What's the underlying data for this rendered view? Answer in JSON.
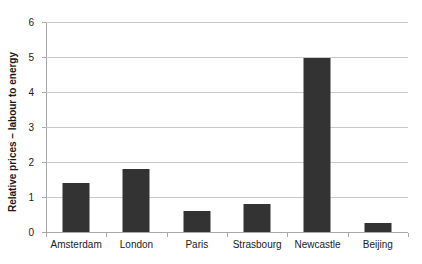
{
  "chart_data": {
    "type": "bar",
    "title": "",
    "xlabel": "",
    "ylabel": "Relative prices – labour to energy",
    "categories": [
      "Amsterdam",
      "London",
      "Paris",
      "Strasbourg",
      "Newcastle",
      "Beijing"
    ],
    "values": [
      1.4,
      1.8,
      0.6,
      0.8,
      4.97,
      0.27
    ],
    "series": [
      {
        "name": "Relative prices – labour to energy",
        "values": [
          1.4,
          1.8,
          0.6,
          0.8,
          4.97,
          0.27
        ]
      }
    ],
    "ylim": [
      0,
      6
    ],
    "yticks": [
      0,
      1,
      2,
      3,
      4,
      5,
      6
    ],
    "ytick_labels": [
      "0",
      "1",
      "2",
      "3",
      "4",
      "5",
      "6"
    ],
    "grid": "horizontal",
    "legend": "none",
    "bar_color": "#333333",
    "gridline_color": "#c8c8c8",
    "axis_color": "#a8a8a8",
    "background": "#ffffff"
  }
}
